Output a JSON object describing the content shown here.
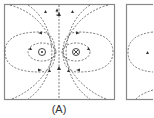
{
  "figure": {
    "panels": [
      {
        "label": "(A)",
        "left_conductor": "current-out-of-page",
        "right_conductor": "current-into-page"
      },
      {
        "label": "",
        "partial": true
      }
    ],
    "line_color": "#555555",
    "border_color": "#777777"
  }
}
